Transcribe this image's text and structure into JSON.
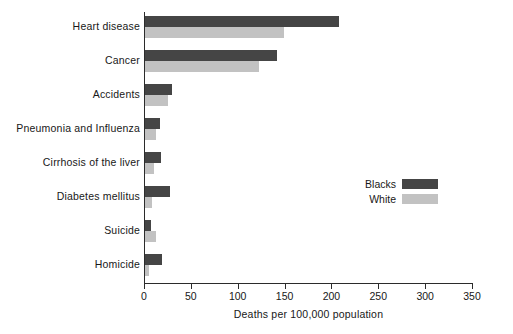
{
  "chart_data": {
    "type": "bar",
    "orientation": "horizontal",
    "title": "",
    "xlabel": "Deaths per 100,000 population",
    "ylabel": "",
    "xlim": [
      0,
      350
    ],
    "xticks": [
      0,
      50,
      100,
      150,
      200,
      250,
      300,
      350
    ],
    "grid": false,
    "legend_position": "middle-right",
    "categories": [
      "Heart disease",
      "Cancer",
      "Accidents",
      "Pneumonia and Influenza",
      "Cirrhosis of the liver",
      "Diabetes mellitus",
      "Suicide",
      "Homicide"
    ],
    "series": [
      {
        "name": "Blacks",
        "color": "#454545",
        "values": [
          207,
          141,
          29,
          16,
          17,
          27,
          6,
          18
        ]
      },
      {
        "name": "White",
        "color": "#c2c2c2",
        "values": [
          148,
          122,
          25,
          12,
          10,
          8,
          12,
          4
        ]
      }
    ]
  },
  "legend": {
    "items": [
      {
        "label": "Blacks",
        "color": "#454545"
      },
      {
        "label": "White",
        "color": "#c2c2c2"
      }
    ]
  }
}
